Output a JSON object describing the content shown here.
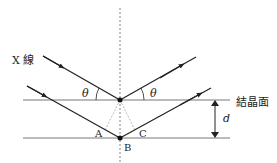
{
  "diagram": {
    "labels": {
      "xray": "X 線",
      "theta_left": "θ",
      "theta_right": "θ",
      "crystal_plane": "結晶面",
      "point_a": "A",
      "point_b": "B",
      "point_c": "C",
      "spacing": "d"
    },
    "colors": {
      "line": "#222222",
      "plane": "#777777",
      "dashed": "#666666"
    }
  }
}
